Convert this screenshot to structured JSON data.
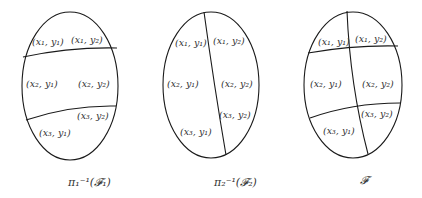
{
  "diagram": {
    "colors": {
      "stroke": "#1a1a1a",
      "text": "#333333",
      "background": "#ffffff"
    },
    "panels": [
      {
        "id": "panel-1",
        "caption": "π₁⁻¹(𝓕₁)",
        "description": "Ellipse split by two horizontal curves into three rows",
        "cells": [
          {
            "label": "(x₁, y₁)"
          },
          {
            "label": "(x₁, y₂)"
          },
          {
            "label": "(x₂, y₁)"
          },
          {
            "label": "(x₂, y₂)"
          },
          {
            "label": "(x₃, y₂)"
          },
          {
            "label": "(x₃, y₁)"
          }
        ]
      },
      {
        "id": "panel-2",
        "caption": "π₂⁻¹(𝓕₂)",
        "description": "Ellipse split by one vertical curve into two columns",
        "cells": [
          {
            "label": "(x₁, y₁)"
          },
          {
            "label": "(x₁, y₂)"
          },
          {
            "label": "(x₂, y₁)"
          },
          {
            "label": "(x₂, y₂)"
          },
          {
            "label": "(x₃, y₂)"
          },
          {
            "label": "(x₃, y₁)"
          }
        ]
      },
      {
        "id": "panel-3",
        "caption": "𝓕",
        "description": "Ellipse split by two horizontal and one vertical curve into six cells",
        "cells": [
          {
            "label": "(x₁, y₁)"
          },
          {
            "label": "(x₁, y₂)"
          },
          {
            "label": "(x₂, y₁)"
          },
          {
            "label": "(x₂, y₂)"
          },
          {
            "label": "(x₃, y₂)"
          },
          {
            "label": "(x₃, y₁)"
          }
        ]
      }
    ]
  }
}
